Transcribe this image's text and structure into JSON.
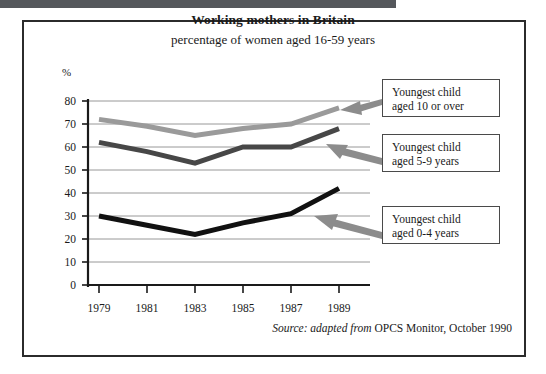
{
  "figure": {
    "title": "Working mothers in Britain",
    "subtitle": "percentage of women aged 16-59 years",
    "source_prefix": "Source: adapted from",
    "source_rest": "OPCS Monitor, October 1990",
    "y_unit": "%"
  },
  "callouts": [
    {
      "line1": "Youngest child",
      "line2": "aged 10 or over"
    },
    {
      "line1": "Youngest child",
      "line2": "aged 5-9 years"
    },
    {
      "line1": "Youngest child",
      "line2": "aged 0-4 years"
    }
  ],
  "colors": {
    "series_10_or_over": "#9a9a9a",
    "series_5_9": "#474747",
    "series_0_4": "#111111",
    "frame": "#2b2b2b",
    "gridline": "#8d8d8d",
    "axis": "#1a1a1a",
    "top_bar": "#55585c",
    "callout_border": "#4a4a4a",
    "arrow": "#8c8c8c"
  },
  "chart_data": {
    "type": "line",
    "title": "Working mothers in Britain",
    "subtitle": "percentage of women aged 16-59 years",
    "xlabel": "",
    "ylabel": "%",
    "ylim": [
      0,
      80
    ],
    "ytick_values": [
      0,
      10,
      20,
      30,
      40,
      50,
      60,
      70,
      80
    ],
    "ytick_labels": [
      "0",
      "10",
      "20",
      "30",
      "40",
      "50",
      "60",
      "70",
      "80"
    ],
    "x": [
      1979,
      1981,
      1983,
      1985,
      1987,
      1989
    ],
    "xtick_labels": [
      "1979",
      "1981",
      "1983",
      "1985",
      "1987",
      "1989"
    ],
    "grid": true,
    "grid_axis": "y",
    "legend": "callout boxes at right",
    "series": [
      {
        "name": "Youngest child aged 10 or over",
        "color": "#9a9a9a",
        "values": [
          72,
          69,
          65,
          68,
          70,
          77
        ]
      },
      {
        "name": "Youngest child aged 5-9 years",
        "color": "#474747",
        "values": [
          62,
          58,
          53,
          60,
          60,
          68
        ]
      },
      {
        "name": "Youngest child aged 0-4 years",
        "color": "#111111",
        "values": [
          30,
          26,
          22,
          27,
          31,
          42
        ]
      }
    ],
    "annotations": [
      "Source: adapted from OPCS Monitor, October 1990"
    ]
  }
}
